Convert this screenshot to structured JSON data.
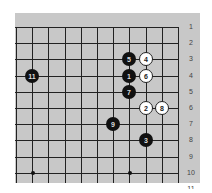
{
  "diagram": {
    "type": "go-board-fragment",
    "row_labels": [
      "1",
      "2",
      "3",
      "4",
      "5",
      "6",
      "7",
      "8",
      "9",
      "10",
      "11"
    ],
    "grid": {
      "cols": 11,
      "rows": 10,
      "origin_x": 16,
      "origin_y": 27,
      "spacing": 16.2
    },
    "star_points": [
      {
        "col": 1,
        "row": 9
      },
      {
        "col": 7,
        "row": 9
      }
    ],
    "stones": [
      {
        "num": "1",
        "color": "black",
        "col": 7,
        "row": 3
      },
      {
        "num": "2",
        "color": "white",
        "col": 8,
        "row": 5
      },
      {
        "num": "3",
        "color": "black",
        "col": 8,
        "row": 7
      },
      {
        "num": "4",
        "color": "white",
        "col": 8,
        "row": 2
      },
      {
        "num": "5",
        "color": "black",
        "col": 7,
        "row": 2
      },
      {
        "num": "6",
        "color": "white",
        "col": 8,
        "row": 3
      },
      {
        "num": "7",
        "color": "black",
        "col": 7,
        "row": 4
      },
      {
        "num": "8",
        "color": "white",
        "col": 9,
        "row": 5
      },
      {
        "num": "9",
        "color": "black",
        "col": 6,
        "row": 6
      },
      {
        "num": "11",
        "color": "black",
        "col": 1,
        "row": 3
      }
    ],
    "colors": {
      "board": "#c8c8c8",
      "line": "#222222",
      "black": "#111111",
      "white": "#ffffff"
    }
  }
}
